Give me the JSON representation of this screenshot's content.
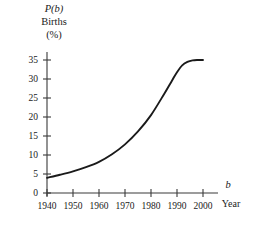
{
  "chart_data": {
    "type": "line",
    "title": "",
    "subtitle": "",
    "ylabel_lines": [
      "P(b)",
      "Births",
      "(%)"
    ],
    "ylabel_function_name": "P",
    "ylabel_variable": "b",
    "ylabel_name": "Births",
    "ylabel_units": "(%)",
    "xlabel_variable": "b",
    "xlabel_name": "Year",
    "xlabel": "Year",
    "ylabel": "Births (%)",
    "xlim": [
      1940,
      2002
    ],
    "ylim": [
      0,
      37
    ],
    "xticks": [
      1940,
      1950,
      1960,
      1970,
      1980,
      1990,
      2000
    ],
    "xtick_labels": [
      "1940",
      "1950",
      "1960",
      "1970",
      "1980",
      "1990",
      "2000"
    ],
    "yticks": [
      0,
      5,
      10,
      15,
      20,
      25,
      30,
      35
    ],
    "ytick_labels": [
      "0",
      "5",
      "10",
      "15",
      "20",
      "25",
      "30",
      "35"
    ],
    "grid": false,
    "legend": null,
    "legend_position": "none",
    "series": [
      {
        "name": "Births (%)",
        "color": "#1a1a1a",
        "x": [
          1940,
          1945,
          1950,
          1955,
          1960,
          1965,
          1970,
          1975,
          1980,
          1985,
          1988,
          1990,
          1992,
          1994,
          1996,
          1998,
          2000,
          2002
        ],
        "values": [
          4.0,
          4.8,
          5.7,
          6.8,
          8.2,
          10.2,
          12.8,
          16.2,
          20.5,
          26.0,
          29.5,
          31.8,
          33.6,
          34.5,
          34.9,
          35.0,
          35.0,
          35.0
        ]
      }
    ],
    "axis_color": "#3a3a3a",
    "curve_color": "#1a1a1a",
    "background_color": "#ffffff"
  },
  "geometry": {
    "plot_left": 47,
    "plot_bottom": 193,
    "x_per_decade": 26,
    "y_per_five": 19,
    "x_axis_end": 218,
    "y_axis_top": 52,
    "curve_end_x": 205
  },
  "annotations": {
    "x_axis_variable_label": "b",
    "x_axis_name_label": "Year"
  }
}
